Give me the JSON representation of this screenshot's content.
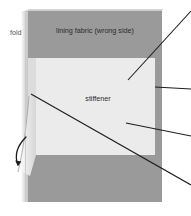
{
  "diagram": {
    "canvas": {
      "width": 191,
      "height": 216,
      "background": "#ffffff"
    },
    "labels": {
      "fold": "fold",
      "lining_fabric": "lining fabric (wrong side)",
      "stiffener": "stiffener"
    },
    "colors": {
      "lining_fabric": "#9a9a9a",
      "stiffener": "#ebebeb",
      "fold_edge_light": "#d2d2d2",
      "fold_edge_mid": "#bdbdbd",
      "fold_top_highlight": "#cfcfcf",
      "leader_line": "#1d1d1d",
      "text": "#2b2b2b",
      "fold_text": "#555555",
      "background": "#ffffff"
    },
    "regions": [
      {
        "name": "lining-fabric-panel",
        "fill": "#9a9a9a",
        "x": 28,
        "y": 11,
        "width": 134,
        "height": 191
      },
      {
        "name": "stiffener-panel",
        "fill": "#ebebeb",
        "x": 36,
        "y": 58,
        "width": 119,
        "height": 97
      },
      {
        "name": "fold-edge-strip",
        "fill": "#cdcdcd",
        "x": 22,
        "y": 9,
        "width": 9,
        "height": 193
      }
    ],
    "leader_lines": [
      {
        "name": "leader-to-lining-fabric",
        "x1": 191,
        "y1": 11,
        "x2": 128,
        "y2": 80
      },
      {
        "name": "leader-to-fabric-edge",
        "x1": 191,
        "y1": 89,
        "x2": 155,
        "y2": 87
      },
      {
        "name": "leader-to-stiffener-edge",
        "x1": 191,
        "y1": 136,
        "x2": 126,
        "y2": 123
      },
      {
        "name": "leader-to-fold-corner",
        "x1": 191,
        "y1": 185,
        "x2": 31,
        "y2": 94
      }
    ],
    "fold_arrow": {
      "name": "fold-direction-arrow",
      "description": "curved arrow indicating fold direction, pointing downward at lower-left"
    }
  }
}
